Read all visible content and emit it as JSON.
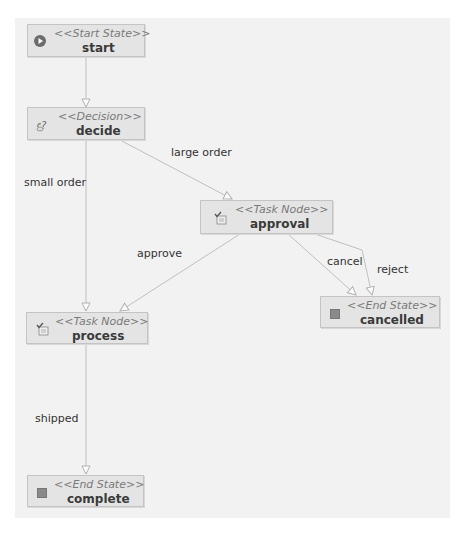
{
  "diagram": {
    "type": "process-definition",
    "nodes": [
      {
        "id": "start",
        "stereotype": "<<Start State>>",
        "name": "start",
        "icon": "start-state-icon"
      },
      {
        "id": "decide",
        "stereotype": "<<Decision>>",
        "name": "decide",
        "icon": "decision-icon"
      },
      {
        "id": "approval",
        "stereotype": "<<Task Node>>",
        "name": "approval",
        "icon": "task-node-icon"
      },
      {
        "id": "process",
        "stereotype": "<<Task Node>>",
        "name": "process",
        "icon": "task-node-icon"
      },
      {
        "id": "cancelled",
        "stereotype": "<<End State>>",
        "name": "cancelled",
        "icon": "end-state-icon"
      },
      {
        "id": "complete",
        "stereotype": "<<End State>>",
        "name": "complete",
        "icon": "end-state-icon"
      }
    ],
    "edges": [
      {
        "from": "start",
        "to": "decide",
        "label": ""
      },
      {
        "from": "decide",
        "to": "process",
        "label": "small order"
      },
      {
        "from": "decide",
        "to": "approval",
        "label": "large order"
      },
      {
        "from": "approval",
        "to": "process",
        "label": "approve"
      },
      {
        "from": "approval",
        "to": "cancelled",
        "label": "cancel"
      },
      {
        "from": "approval",
        "to": "cancelled",
        "label": "reject"
      },
      {
        "from": "process",
        "to": "complete",
        "label": "shipped"
      }
    ]
  },
  "colors": {
    "canvas": "#f2f2f2",
    "node_fill": "#e4e4e4",
    "node_border": "#c4c4c4",
    "edge": "#b8b8b8"
  }
}
